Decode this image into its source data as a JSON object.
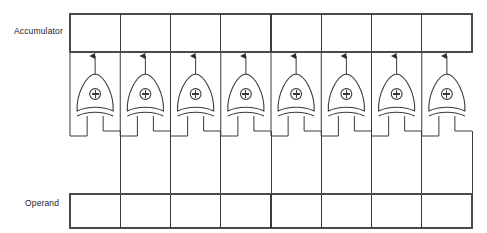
{
  "diagram": {
    "type": "logic-circuit",
    "bit_width": 8,
    "gate_symbol": "⊕",
    "gate_type": "XOR",
    "colors": {
      "background": "#ffffff",
      "line": "#3a3a3a",
      "register_border": "#4a4a4a",
      "text": "#1a1a1a"
    },
    "registers": [
      {
        "id": "accumulator",
        "label": "Accumulator",
        "position": "top",
        "cells": [
          "",
          "",
          "",
          "",
          "",
          "",
          "",
          ""
        ]
      },
      {
        "id": "operand",
        "label": "Operand",
        "position": "bottom",
        "cells": [
          "",
          "",
          "",
          "",
          "",
          "",
          "",
          ""
        ]
      }
    ],
    "gates": [
      {
        "index": 0,
        "symbol": "⊕"
      },
      {
        "index": 1,
        "symbol": "⊕"
      },
      {
        "index": 2,
        "symbol": "⊕"
      },
      {
        "index": 3,
        "symbol": "⊕"
      },
      {
        "index": 4,
        "symbol": "⊕"
      },
      {
        "index": 5,
        "symbol": "⊕"
      },
      {
        "index": 6,
        "symbol": "⊕"
      },
      {
        "index": 7,
        "symbol": "⊕"
      }
    ],
    "geometry": {
      "reg_left": 70,
      "reg_right": 472,
      "acc_top": 14,
      "acc_bottom": 52,
      "op_top": 194,
      "op_bottom": 228,
      "cell_width": 50.25,
      "gate_top": 74,
      "gate_bottom": 117,
      "gate_half_width": 18,
      "feedback_y": 136
    }
  }
}
